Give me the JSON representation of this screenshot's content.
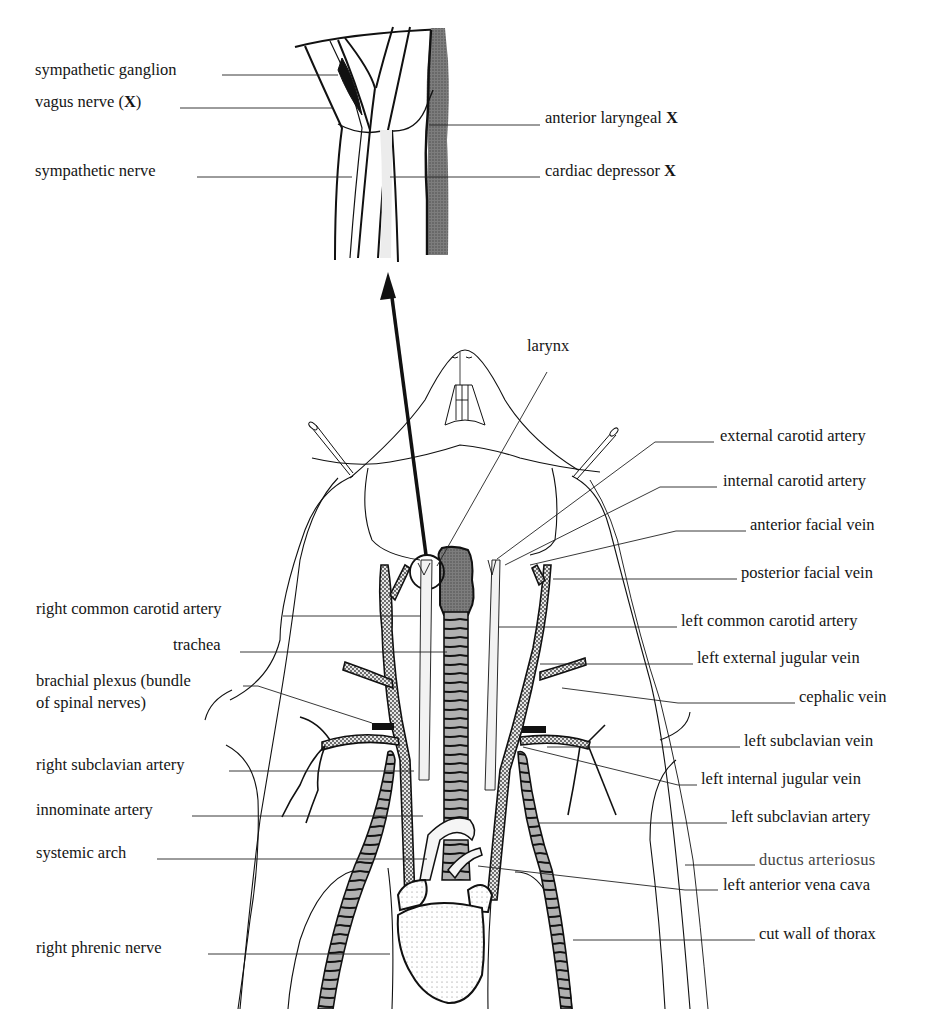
{
  "figure": {
    "inset": {
      "labels": [
        {
          "id": "sympathetic-ganglion",
          "text": "sympathetic ganglion",
          "x": 35,
          "y": 66,
          "side": "left"
        },
        {
          "id": "vagus-nerve",
          "text": "vagus nerve (X)",
          "x": 35,
          "y": 98,
          "side": "left"
        },
        {
          "id": "anterior-laryngeal",
          "text": "anterior laryngeal X",
          "x": 545,
          "y": 114,
          "side": "right"
        },
        {
          "id": "sympathetic-nerve",
          "text": "sympathetic nerve",
          "x": 35,
          "y": 167,
          "side": "left"
        },
        {
          "id": "cardiac-depressor",
          "text": "cardiac depressor X",
          "x": 545,
          "y": 167,
          "side": "right"
        }
      ]
    },
    "main": {
      "labels": [
        {
          "id": "larynx",
          "text": "larynx",
          "x": 527,
          "y": 342,
          "side": "top"
        },
        {
          "id": "external-carotid-artery",
          "text": "external carotid artery",
          "x": 720,
          "y": 432,
          "side": "right"
        },
        {
          "id": "internal-carotid-artery",
          "text": "internal carotid artery",
          "x": 723,
          "y": 477,
          "side": "right"
        },
        {
          "id": "anterior-facial-vein",
          "text": "anterior facial vein",
          "x": 750,
          "y": 521,
          "side": "right"
        },
        {
          "id": "posterior-facial-vein",
          "text": "posterior facial vein",
          "x": 741,
          "y": 569,
          "side": "right"
        },
        {
          "id": "right-common-carotid-artery",
          "text": "right common carotid artery",
          "x": 36,
          "y": 605,
          "side": "left"
        },
        {
          "id": "left-common-carotid-artery",
          "text": "left common carotid artery",
          "x": 681,
          "y": 617,
          "side": "right"
        },
        {
          "id": "trachea",
          "text": "trachea",
          "x": 173,
          "y": 641,
          "side": "left"
        },
        {
          "id": "left-external-jugular-vein",
          "text": "left external jugular vein",
          "x": 697,
          "y": 654,
          "side": "right"
        },
        {
          "id": "brachial-plexus",
          "text": "brachial plexus (bundle",
          "x": 36,
          "y": 677,
          "side": "left"
        },
        {
          "id": "brachial-plexus-2",
          "text": "of spinal nerves)",
          "x": 36,
          "y": 699,
          "side": "left"
        },
        {
          "id": "cephalic-vein",
          "text": "cephalic vein",
          "x": 799,
          "y": 693,
          "side": "right"
        },
        {
          "id": "left-subclavian-vein",
          "text": "left subclavian vein",
          "x": 744,
          "y": 737,
          "side": "right"
        },
        {
          "id": "right-subclavian-artery",
          "text": "right subclavian artery",
          "x": 36,
          "y": 761,
          "side": "left"
        },
        {
          "id": "left-internal-jugular-vein",
          "text": "left internal jugular vein",
          "x": 701,
          "y": 775,
          "side": "right"
        },
        {
          "id": "innominate-artery",
          "text": "innominate artery",
          "x": 36,
          "y": 806,
          "side": "left"
        },
        {
          "id": "left-subclavian-artery",
          "text": "left subclavian artery",
          "x": 731,
          "y": 813,
          "side": "right"
        },
        {
          "id": "systemic-arch",
          "text": "systemic arch",
          "x": 36,
          "y": 849,
          "side": "left"
        },
        {
          "id": "ductus-arteriosus",
          "text": "ductus arteriosus",
          "x": 759,
          "y": 856,
          "side": "right"
        },
        {
          "id": "left-anterior-vena-cava",
          "text": "left anterior vena cava",
          "x": 723,
          "y": 881,
          "side": "right"
        },
        {
          "id": "right-phrenic-nerve",
          "text": "right phrenic nerve",
          "x": 36,
          "y": 944,
          "side": "left"
        },
        {
          "id": "cut-wall-of-thorax",
          "text": "cut wall of thorax",
          "x": 759,
          "y": 930,
          "side": "right"
        }
      ]
    },
    "leaders": [
      [
        222,
        75,
        338,
        75
      ],
      [
        180,
        108,
        333,
        108
      ],
      [
        429,
        125,
        540,
        125
      ],
      [
        197,
        177,
        352,
        177
      ],
      [
        390,
        177,
        540,
        177
      ],
      [
        547,
        372,
        437,
        566
      ],
      [
        714,
        442,
        655,
        442,
        497,
        559
      ],
      [
        717,
        487,
        660,
        487,
        505,
        565
      ],
      [
        746,
        531,
        676,
        531,
        530,
        565
      ],
      [
        737,
        579,
        553,
        579
      ],
      [
        283,
        616,
        421,
        616
      ],
      [
        677,
        627,
        499,
        627
      ],
      [
        240,
        652,
        447,
        652
      ],
      [
        693,
        664,
        540,
        664
      ],
      [
        243,
        686,
        258,
        686,
        372,
        723
      ],
      [
        795,
        703,
        678,
        703,
        562,
        688
      ],
      [
        740,
        747,
        547,
        747
      ],
      [
        229,
        771,
        414,
        771
      ],
      [
        697,
        785,
        678,
        785,
        523,
        747
      ],
      [
        192,
        816,
        423,
        816
      ],
      [
        727,
        823,
        538,
        823
      ],
      [
        157,
        859,
        427,
        859
      ],
      [
        755,
        865,
        685,
        865
      ],
      [
        718,
        890,
        685,
        890,
        478,
        866
      ],
      [
        208,
        954,
        390,
        954
      ],
      [
        755,
        940,
        685,
        940,
        573,
        940
      ]
    ],
    "arrow": {
      "from": [
        426,
        555
      ],
      "to": [
        388,
        272
      ]
    },
    "colors": {
      "ink": "#111111",
      "stipple_dark": "#8a8a8a",
      "stipple_mid": "#b5b5b5",
      "background": "#ffffff"
    }
  }
}
